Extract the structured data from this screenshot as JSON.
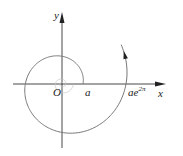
{
  "figure": {
    "type": "logarithmic-spiral",
    "colors": {
      "axis": "#333333",
      "curve": "#777777",
      "inner_curve": "#c8c8c8",
      "arrow": "#222222",
      "text": "#222222"
    },
    "labels": {
      "y_axis": "y",
      "x_axis": "x",
      "origin": "O",
      "a": "a",
      "ae2pi_base": "ae",
      "ae2pi_exp": "2π"
    },
    "geometry": {
      "origin": [
        62,
        84
      ],
      "r0": 21,
      "r_at_2pi": 64,
      "theta_end": 6.9
    }
  }
}
